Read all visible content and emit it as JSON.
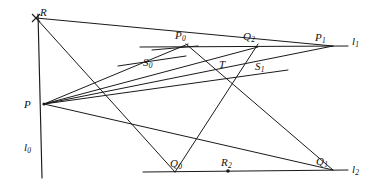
{
  "figure": {
    "type": "geometry-diagram",
    "title": "",
    "width": 378,
    "height": 190,
    "background_color": "#ffffff",
    "stroke_color": "#1a1a1a",
    "label_color": "#111111"
  },
  "points": [
    {
      "id": "R",
      "base": "R",
      "sub": "",
      "x": 36,
      "y": 18,
      "label_x": 40,
      "label_y": 7,
      "marked": true
    },
    {
      "id": "P",
      "base": "P",
      "sub": "",
      "x": 44,
      "y": 104,
      "label_x": 24,
      "label_y": 99,
      "marked": true
    },
    {
      "id": "P0",
      "base": "P",
      "sub": "0",
      "x": 187,
      "y": 45,
      "label_x": 175,
      "label_y": 30,
      "marked": false
    },
    {
      "id": "Q2",
      "base": "Q",
      "sub": "2",
      "x": 252,
      "y": 48,
      "label_x": 243,
      "label_y": 31,
      "marked": false
    },
    {
      "id": "P1",
      "base": "P",
      "sub": "1",
      "x": 330,
      "y": 47,
      "label_x": 315,
      "label_y": 32,
      "marked": false
    },
    {
      "id": "S0",
      "base": "S",
      "sub": "0",
      "x": 155,
      "y": 58,
      "label_x": 143,
      "label_y": 57,
      "marked": false
    },
    {
      "id": "T",
      "base": "T",
      "sub": "",
      "x": 222,
      "y": 58,
      "label_x": 219,
      "label_y": 59,
      "marked": false
    },
    {
      "id": "S1",
      "base": "S",
      "sub": "1",
      "x": 262,
      "y": 61,
      "label_x": 255,
      "label_y": 61,
      "marked": false
    },
    {
      "id": "Q0",
      "base": "Q",
      "sub": "0",
      "x": 172,
      "y": 171,
      "label_x": 170,
      "label_y": 158,
      "marked": false
    },
    {
      "id": "R2",
      "base": "R",
      "sub": "2",
      "x": 228,
      "y": 171,
      "label_x": 221,
      "label_y": 157,
      "marked": true
    },
    {
      "id": "Q1",
      "base": "Q",
      "sub": "1",
      "x": 330,
      "y": 171,
      "label_x": 316,
      "label_y": 156,
      "marked": false
    }
  ],
  "lines": [
    {
      "id": "l0",
      "base": "l",
      "sub": "0",
      "label_x": 24,
      "label_y": 142,
      "x1": 38,
      "y1": 14,
      "x2": 42,
      "y2": 178
    },
    {
      "id": "l1",
      "base": "l",
      "sub": "1",
      "label_x": 352,
      "label_y": 36,
      "x1": 140,
      "y1": 47,
      "x2": 348,
      "y2": 46
    },
    {
      "id": "l2",
      "base": "l",
      "sub": "2",
      "label_x": 352,
      "label_y": 164,
      "x1": 143,
      "y1": 172,
      "x2": 348,
      "y2": 170
    }
  ],
  "segments": [
    {
      "name": "R-to-P1",
      "x1": 36,
      "y1": 18,
      "x2": 333,
      "y2": 46
    },
    {
      "name": "R-to-Q0",
      "x1": 36,
      "y1": 18,
      "x2": 175,
      "y2": 172
    },
    {
      "name": "P-to-P1-upper",
      "x1": 44,
      "y1": 104,
      "x2": 333,
      "y2": 46
    },
    {
      "name": "P-to-Q2",
      "x1": 44,
      "y1": 104,
      "x2": 258,
      "y2": 47
    },
    {
      "name": "P-to-P0",
      "x1": 44,
      "y1": 104,
      "x2": 188,
      "y2": 44
    },
    {
      "name": "P-to-S1-ext",
      "x1": 44,
      "y1": 104,
      "x2": 288,
      "y2": 70
    },
    {
      "name": "P-to-Q1",
      "x1": 44,
      "y1": 104,
      "x2": 333,
      "y2": 170
    },
    {
      "name": "P0-to-Q1",
      "x1": 186,
      "y1": 44,
      "x2": 333,
      "y2": 170
    },
    {
      "name": "Q0-to-Q2",
      "x1": 175,
      "y1": 172,
      "x2": 258,
      "y2": 44
    },
    {
      "name": "tick-S0",
      "x1": 118,
      "y1": 66,
      "x2": 186,
      "y2": 56
    },
    {
      "name": "tick-P0",
      "x1": 152,
      "y1": 50,
      "x2": 198,
      "y2": 46
    }
  ]
}
